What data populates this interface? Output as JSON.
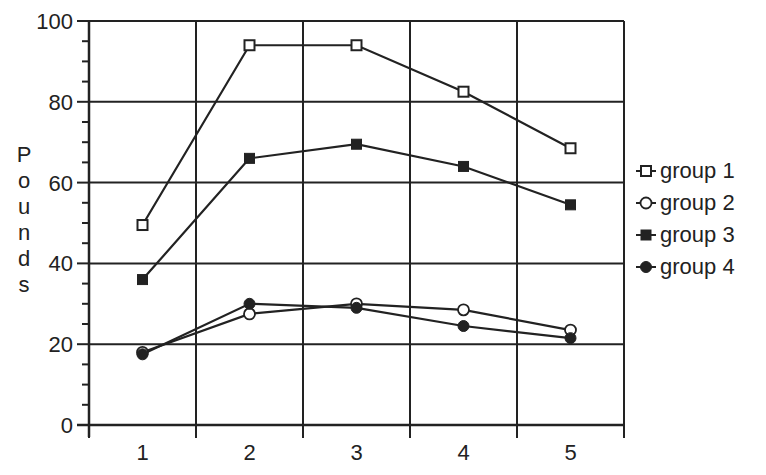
{
  "chart_data": {
    "type": "line",
    "title": "",
    "xlabel": "",
    "ylabel": "Pounds",
    "x": [
      1,
      2,
      3,
      4,
      5
    ],
    "categories": [
      "1",
      "2",
      "3",
      "4",
      "5"
    ],
    "ylim": [
      0,
      100
    ],
    "y_ticks": [
      0,
      20,
      40,
      60,
      80,
      100
    ],
    "y_minor_step": 5,
    "grid": true,
    "legend_position": "right",
    "series": [
      {
        "name": "group 1",
        "marker": "open-square",
        "values": [
          49.5,
          94,
          94,
          82.5,
          68.5
        ]
      },
      {
        "name": "group 2",
        "marker": "open-circle",
        "values": [
          18,
          27.5,
          30,
          28.5,
          23.5
        ]
      },
      {
        "name": "group 3",
        "marker": "filled-square",
        "values": [
          36,
          66,
          69.5,
          64,
          54.5
        ]
      },
      {
        "name": "group 4",
        "marker": "filled-circle",
        "values": [
          17.5,
          30,
          29,
          24.5,
          21.5
        ]
      }
    ]
  },
  "legend": {
    "items": [
      {
        "label": "group 1",
        "marker": "open-square"
      },
      {
        "label": "group 2",
        "marker": "open-circle"
      },
      {
        "label": "group 3",
        "marker": "filled-square"
      },
      {
        "label": "group 4",
        "marker": "filled-circle"
      }
    ]
  },
  "colors": {
    "line": "#222222",
    "background": "#ffffff"
  }
}
